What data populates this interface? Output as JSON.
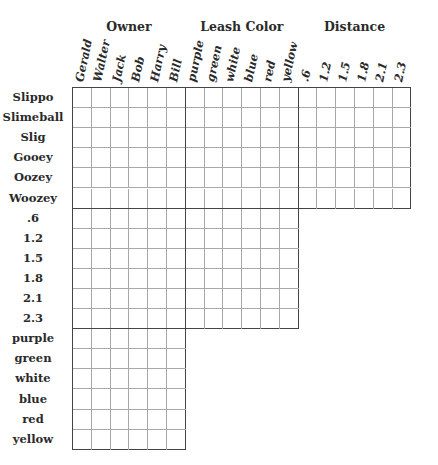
{
  "puzzle": {
    "column_categories": [
      {
        "title": "Owner",
        "items": [
          "Gerald",
          "Walter",
          "Jack",
          "Bob",
          "Harry",
          "Bill"
        ]
      },
      {
        "title": "Leash Color",
        "items": [
          "purple",
          "green",
          "white",
          "blue",
          "red",
          "yellow"
        ]
      },
      {
        "title": "Distance",
        "items": [
          ".6",
          "1.2",
          "1.5",
          "1.8",
          "2.1",
          "2.3"
        ]
      }
    ],
    "row_categories": [
      {
        "title": "Name",
        "items": [
          "Slippo",
          "Slimeball",
          "Slig",
          "Gooey",
          "Oozey",
          "Woozey"
        ]
      },
      {
        "title": "Distance",
        "items": [
          ".6",
          "1.2",
          "1.5",
          "1.8",
          "2.1",
          "2.3"
        ]
      },
      {
        "title": "Leash Color",
        "items": [
          "purple",
          "green",
          "white",
          "blue",
          "red",
          "yellow"
        ]
      }
    ],
    "blocks": [
      {
        "row_group": 0,
        "col_group": 0
      },
      {
        "row_group": 0,
        "col_group": 1
      },
      {
        "row_group": 0,
        "col_group": 2
      },
      {
        "row_group": 1,
        "col_group": 0
      },
      {
        "row_group": 1,
        "col_group": 1
      },
      {
        "row_group": 2,
        "col_group": 0
      }
    ]
  }
}
